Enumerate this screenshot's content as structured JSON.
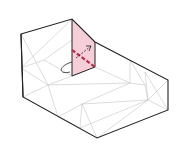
{
  "diagram": {
    "colors": {
      "background": "#ffffff",
      "outline": "#222222",
      "mesh": "#bbbbbb",
      "plane_fill": "#f4c6d0",
      "plane_line": "#b0304e"
    },
    "outline_path": "M21,34 L72,19 L95,42 L168,80 L168,110 L97,138 L23,97 Z",
    "plane": {
      "points": "72,19 95,42 95,67 72,76"
    }
  }
}
